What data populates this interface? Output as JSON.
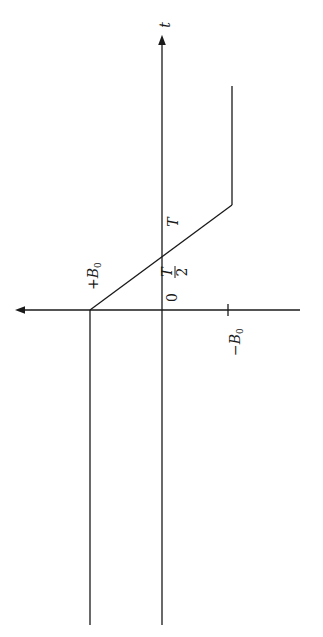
{
  "diagram": {
    "orientation": "rotated 90 degrees counter-clockwise",
    "axes": {
      "time_axis_label": "t",
      "amplitude_axis_label": ""
    },
    "labels": {
      "plus_b0_sign": "+",
      "plus_b0_main": "B",
      "plus_b0_sub": "0",
      "minus_b0_sign": "−",
      "minus_b0_main": "B",
      "minus_b0_sub": "0",
      "origin": "0",
      "half_period_num": "T",
      "half_period_den": "2",
      "period": "T"
    },
    "waveform": {
      "description": "B(t) = +B0 for t<0, linear ramp from +B0 at t=0 to -B0 at t=T, then constant -B0 for t>T",
      "segments": [
        {
          "from": "t<0",
          "value": "+B0"
        },
        {
          "from": "t=0",
          "to": "t=T",
          "value": "linear +B0 → -B0"
        },
        {
          "from": "t>T",
          "value": "-B0"
        }
      ]
    },
    "colors": {
      "line": "#1a1a1a",
      "background": "#ffffff"
    }
  }
}
